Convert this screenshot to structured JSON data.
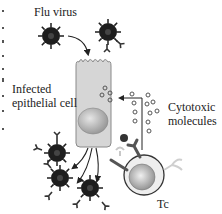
{
  "labels": {
    "flu_virus": "Flu virus",
    "infected_cell_line1": "Infected",
    "infected_cell_line2": "epithelial cell",
    "cytotoxic_line1": "Cytotoxic",
    "cytotoxic_line2": "molecules",
    "tc": "Tc"
  },
  "colors": {
    "virus": "#1e1e1e",
    "cell_fill": "#d4d4d4",
    "cell_stroke": "#8a8a8a",
    "nucleus": "#b0b0b0",
    "tc_ring": "#e8e8e8",
    "arrow": "#222222",
    "granule": "#666666"
  }
}
